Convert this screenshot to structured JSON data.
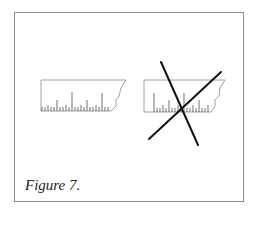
{
  "figure": {
    "caption": "Figure 7.",
    "panels": [
      {
        "name": "ruler",
        "description": "torn ruler segment with tick marks"
      },
      {
        "name": "ruler-crossed-out",
        "description": "same ruler crossed out with a large X"
      }
    ],
    "colors": {
      "border": "#8a8a8a",
      "ink": "#111111",
      "ruler_outline": "#999999"
    }
  }
}
